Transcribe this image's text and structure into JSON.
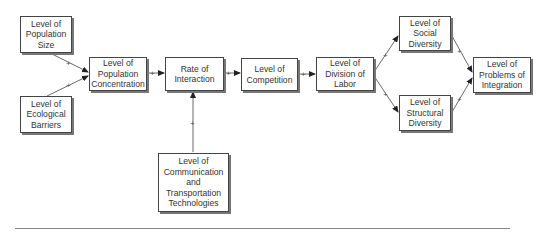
{
  "diagram": {
    "nodes": {
      "population_size": "Level of\nPopulation\nSize",
      "ecological_barriers": "Level of\nEcological\nBarriers",
      "population_concentration": "Level of\nPopulation\nConcentration",
      "rate_of_interaction": "Rate of\nInteraction",
      "competition": "Level of\nCompetition",
      "division_of_labor": "Level of\nDivision of\nLabor",
      "social_diversity": "Level of\nSocial\nDiversity",
      "structural_diversity": "Level of\nStructural\nDiversity",
      "problems_of_integration": "Level of\nProblems of\nIntegration",
      "communication_transportation": "Level of\nCommunication\nand\nTransportation\nTechnologies"
    },
    "edges": [
      {
        "from": "population_size",
        "to": "population_concentration",
        "sign": "+"
      },
      {
        "from": "ecological_barriers",
        "to": "population_concentration",
        "sign": "+"
      },
      {
        "from": "population_concentration",
        "to": "rate_of_interaction",
        "sign": "+"
      },
      {
        "from": "communication_transportation",
        "to": "rate_of_interaction",
        "sign": "+"
      },
      {
        "from": "rate_of_interaction",
        "to": "competition",
        "sign": "+"
      },
      {
        "from": "competition",
        "to": "division_of_labor",
        "sign": "+"
      },
      {
        "from": "division_of_labor",
        "to": "social_diversity",
        "sign": "+"
      },
      {
        "from": "division_of_labor",
        "to": "structural_diversity",
        "sign": "+"
      },
      {
        "from": "social_diversity",
        "to": "problems_of_integration",
        "sign": "+"
      },
      {
        "from": "structural_diversity",
        "to": "problems_of_integration",
        "sign": "+"
      }
    ],
    "sign_label": "+"
  }
}
